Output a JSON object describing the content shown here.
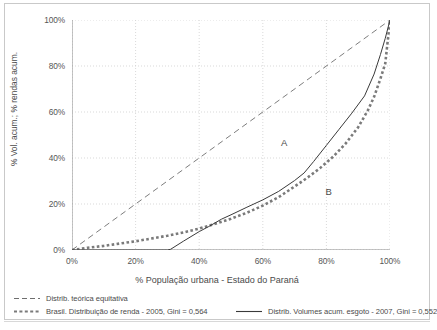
{
  "chart_data": {
    "type": "line",
    "title": "",
    "xlabel": "% População urbana - Estado do Paraná",
    "ylabel": "% Vol. acum.; % rendas acum.",
    "xlim": [
      0,
      100
    ],
    "ylim": [
      0,
      100
    ],
    "grid": true,
    "legend_position": "below",
    "xticks": [
      "0%",
      "20%",
      "40%",
      "60%",
      "80%",
      "100%"
    ],
    "xtick_values": [
      0,
      20,
      40,
      60,
      80,
      100
    ],
    "yticks": [
      "0%",
      "20%",
      "40%",
      "60%",
      "80%",
      "100%"
    ],
    "ytick_values": [
      0,
      20,
      40,
      60,
      80,
      100
    ],
    "annotations": [
      {
        "text": "A",
        "x": 67,
        "y": 46
      },
      {
        "text": "B",
        "x": 81,
        "y": 25
      }
    ],
    "series": [
      {
        "name": "Distrib. teórica equitativa",
        "style": "dashed",
        "color": "#6e6e6e",
        "x": [
          0,
          100
        ],
        "values": [
          0,
          100
        ]
      },
      {
        "name": "Brasil. Distribuição de renda - 2005, Gini = 0,564",
        "style": "dotted-square",
        "color": "#7a7a7a",
        "x": [
          0,
          5,
          10,
          15,
          20,
          25,
          30,
          35,
          40,
          45,
          50,
          55,
          60,
          65,
          70,
          74,
          78,
          82,
          86,
          90,
          93,
          95,
          97,
          98.5,
          100
        ],
        "values": [
          0,
          1,
          1.8,
          2.8,
          3.8,
          5.0,
          6.2,
          7.6,
          9.3,
          11.4,
          13.6,
          16.2,
          19.3,
          23.0,
          27.6,
          31.4,
          35.6,
          40.4,
          46.2,
          53.4,
          60.6,
          66.6,
          74.5,
          81.0,
          100
        ]
      },
      {
        "name": "Distrib. Volumes acum. esgoto - 2007, Gini = 0,552",
        "style": "solid",
        "color": "#3a3a3a",
        "x": [
          0,
          10,
          20,
          30,
          31,
          35,
          40,
          43,
          47,
          50,
          55,
          60,
          65,
          70,
          73,
          76,
          80,
          84,
          88,
          92,
          95,
          97,
          98.5,
          100
        ],
        "values": [
          0,
          0,
          0,
          0,
          0.3,
          3.8,
          8.0,
          10.2,
          13.4,
          15.3,
          18.6,
          21.8,
          25.5,
          30.2,
          33.5,
          38.5,
          45.5,
          52.5,
          59.5,
          67.0,
          76.5,
          85.0,
          92.0,
          100
        ]
      }
    ]
  },
  "legend": {
    "entries": [
      {
        "label": "Distrib. teórica equitativa",
        "marker": "dashed-line-icon"
      },
      {
        "label": "Brasil. Distribuição de renda - 2005, Gini = 0,564",
        "marker": "dotted-square-line-icon"
      },
      {
        "label": "Distrib. Volumes acum. esgoto - 2007, Gini = 0,552",
        "marker": "solid-line-icon"
      }
    ]
  },
  "colors": {
    "grid": "#cfcfcf",
    "axis": "#8a8a8a",
    "text": "#4a4a4a",
    "frame": "#c9c9c9",
    "equity_line": "#6e6e6e",
    "income_line": "#7a7a7a",
    "sewage_line": "#3a3a3a"
  }
}
